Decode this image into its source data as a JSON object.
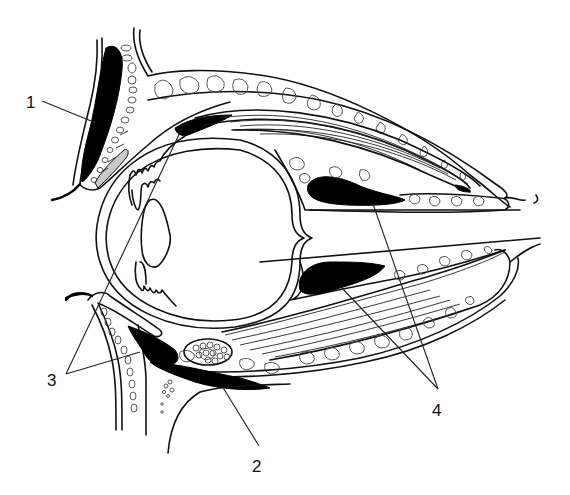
{
  "figure": {
    "type": "anatomical-cross-section",
    "background": "#ffffff",
    "ink_color": "#000000",
    "highlight_grey": "#c9c9c9"
  },
  "labels": [
    {
      "id": "1",
      "text": "1",
      "x": 30,
      "y": 108,
      "leaders": [
        [
          42,
          101,
          96,
          123
        ]
      ]
    },
    {
      "id": "2",
      "text": "2",
      "x": 252,
      "y": 472,
      "leaders": [
        [
          259,
          447,
          222,
          386
        ]
      ]
    },
    {
      "id": "3",
      "text": "3",
      "x": 47,
      "y": 386,
      "leaders": [
        [
          66,
          374,
          183,
          126
        ],
        [
          66,
          374,
          140,
          352
        ]
      ]
    },
    {
      "id": "4",
      "text": "4",
      "x": 436,
      "y": 416,
      "leaders": [
        [
          438,
          389,
          373,
          204
        ],
        [
          438,
          389,
          341,
          287
        ]
      ]
    }
  ]
}
